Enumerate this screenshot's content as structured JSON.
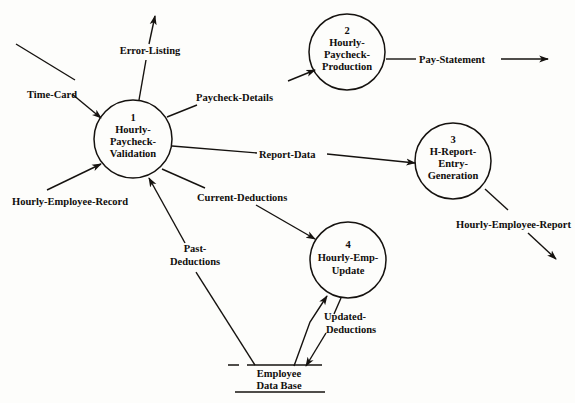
{
  "diagram": {
    "type": "data-flow-diagram",
    "stroke_color": "#15120f",
    "background_color": "#fdfdfb",
    "processes": [
      {
        "id": "1",
        "number": "1",
        "name_lines": [
          "Hourly-",
          "Paycheck-",
          "Validation"
        ],
        "cx": 133,
        "cy": 139,
        "r": 39
      },
      {
        "id": "2",
        "number": "2",
        "name_lines": [
          "Hourly-",
          "Paycheck-",
          "Production"
        ],
        "cx": 347,
        "cy": 52,
        "r": 38
      },
      {
        "id": "3",
        "number": "3",
        "name_lines": [
          "H-Report-",
          "Entry-",
          "Generation"
        ],
        "cx": 453,
        "cy": 161,
        "r": 38
      },
      {
        "id": "4",
        "number": "4",
        "name_lines": [
          "Hourly-Emp-",
          "Update"
        ],
        "cx": 348,
        "cy": 260,
        "r": 38
      }
    ],
    "data_stores": [
      {
        "id": "employee-data-base",
        "name_lines": [
          "Employee",
          "Data Base"
        ],
        "cx": 277,
        "top_y": 365,
        "bottom_y": 392
      }
    ],
    "flows": [
      {
        "id": "time-card",
        "label": "Time-Card",
        "from": "external-source",
        "to": "1"
      },
      {
        "id": "error-listing",
        "label": "Error-Listing",
        "from": "1",
        "to": "external-sink"
      },
      {
        "id": "hourly-employee-record",
        "label": "Hourly-Employee-Record",
        "from": "external-source",
        "to": "1"
      },
      {
        "id": "paycheck-details",
        "label": "Paycheck-Details",
        "from": "1",
        "to": "2"
      },
      {
        "id": "report-data",
        "label": "Report-Data",
        "from": "1",
        "to": "3"
      },
      {
        "id": "current-deductions",
        "label": "Current-Deductions",
        "from": "1",
        "to": "4"
      },
      {
        "id": "past-deductions",
        "label": "Past-",
        "label_line2": "Deductions",
        "from": "employee-data-base",
        "to": "1"
      },
      {
        "id": "pay-statement",
        "label": "Pay-Statement",
        "from": "2",
        "to": "external-sink"
      },
      {
        "id": "hourly-employee-report",
        "label": "Hourly-Employee-Report",
        "from": "3",
        "to": "external-sink"
      },
      {
        "id": "updated-deductions",
        "label": "Updated-",
        "label_line2": "Deductions",
        "from": "4",
        "to": "employee-data-base"
      }
    ]
  },
  "labels": {
    "time_card": "Time-Card",
    "error_listing": "Error-Listing",
    "hourly_employee_record": "Hourly-Employee-Record",
    "paycheck_details": "Paycheck-Details",
    "report_data": "Report-Data",
    "current_deductions": "Current-Deductions",
    "past_deductions_l1": "Past-",
    "past_deductions_l2": "Deductions",
    "pay_statement": "Pay-Statement",
    "hourly_employee_report": "Hourly-Employee-Report",
    "updated_deductions_l1": "Updated-",
    "updated_deductions_l2": "Deductions",
    "store_l1": "Employee",
    "store_l2": "Data Base"
  },
  "process1": {
    "num": "1",
    "l1": "Hourly-",
    "l2": "Paycheck-",
    "l3": "Validation"
  },
  "process2": {
    "num": "2",
    "l1": "Hourly-",
    "l2": "Paycheck-",
    "l3": "Production"
  },
  "process3": {
    "num": "3",
    "l1": "H-Report-",
    "l2": "Entry-",
    "l3": "Generation"
  },
  "process4": {
    "num": "4",
    "l1": "Hourly-Emp-",
    "l2": "Update"
  }
}
